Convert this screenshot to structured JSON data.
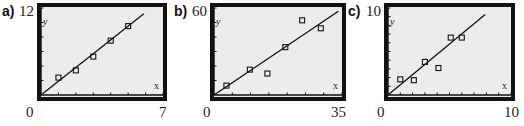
{
  "colors": {
    "frame": "#111111",
    "plot_bg": "#ececec",
    "line": "#111111",
    "marker": "#111111"
  },
  "panels": [
    {
      "label": "a)",
      "xmin_label": "0",
      "xmax_label": "7",
      "ymax_label": "12",
      "axis_x_label": "x",
      "axis_y_label": "y"
    },
    {
      "label": "b)",
      "xmin_label": "0",
      "xmax_label": "35",
      "ymax_label": "60",
      "axis_x_label": "x",
      "axis_y_label": "y"
    },
    {
      "label": "c)",
      "xmin_label": "0",
      "xmax_label": "10",
      "ymax_label": "10",
      "axis_x_label": "x",
      "axis_y_label": "y"
    }
  ],
  "chart_data": [
    {
      "type": "scatter",
      "title": "a)",
      "xlabel": "x",
      "ylabel": "y",
      "xlim": [
        0,
        7
      ],
      "ylim": [
        0,
        12
      ],
      "xticks_step": 1,
      "yticks_step": 2,
      "points": [
        [
          1,
          2.4
        ],
        [
          2,
          3.4
        ],
        [
          3,
          5.3
        ],
        [
          4,
          7.5
        ],
        [
          5,
          9.5
        ]
      ],
      "regression_line": {
        "slope": 1.9,
        "intercept": 0,
        "x_range": [
          0,
          5.9
        ]
      },
      "grid": false
    },
    {
      "type": "scatter",
      "title": "b)",
      "xlabel": "x",
      "ylabel": "y",
      "xlim": [
        0,
        35
      ],
      "ylim": [
        0,
        60
      ],
      "xticks_step": 5,
      "yticks_step": 10,
      "points": [
        [
          3.4,
          6.5
        ],
        [
          9.8,
          17.5
        ],
        [
          14.6,
          14.8
        ],
        [
          19.5,
          33
        ],
        [
          24.1,
          51.5
        ],
        [
          29.2,
          46
        ]
      ],
      "regression_line": {
        "slope": 1.7,
        "intercept": 0,
        "x_range": [
          0,
          34
        ]
      },
      "grid": false
    },
    {
      "type": "scatter",
      "title": "c)",
      "xlabel": "x",
      "ylabel": "y",
      "xlim": [
        0,
        10
      ],
      "ylim": [
        0,
        10
      ],
      "xticks_step": 1,
      "yticks_step": 1,
      "points": [
        [
          1,
          1.8
        ],
        [
          2.1,
          1.7
        ],
        [
          3,
          3.8
        ],
        [
          4.1,
          3.1
        ],
        [
          5.1,
          6.6
        ],
        [
          6,
          6.6
        ]
      ],
      "regression_line": {
        "slope": 1.17,
        "intercept": 0,
        "x_range": [
          0,
          7.9
        ]
      },
      "grid": false
    }
  ]
}
